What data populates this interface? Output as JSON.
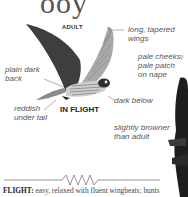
{
  "page": {
    "title_fragment": "ooy"
  },
  "illustration": {
    "age_label": "ADULT",
    "view_label": "IN FLIGHT",
    "annotations": [
      {
        "id": "wings",
        "text_line1": "long, tapered",
        "text_line2": "wings"
      },
      {
        "id": "cheeks",
        "text_line1": "pale cheeks;",
        "text_line2": "pale patch",
        "text_line3": "on nape"
      },
      {
        "id": "back",
        "text_line1": "plain dark",
        "text_line2": "back"
      },
      {
        "id": "below",
        "text_line1": "dark below"
      },
      {
        "id": "tail",
        "text_line1": "reddish",
        "text_line2": "under tail"
      },
      {
        "id": "juvenile",
        "text_line1": "slightly browner",
        "text_line2": "than adult"
      }
    ]
  },
  "flight": {
    "label": "FLIGHT:",
    "text": " easy, relaxed with fluent wingbeats; hunts"
  },
  "colors": {
    "bird_dark": "#3a3a3a",
    "bird_mid": "#6e6e6e",
    "bird_light": "#b9b9b9",
    "text": "#555555"
  }
}
